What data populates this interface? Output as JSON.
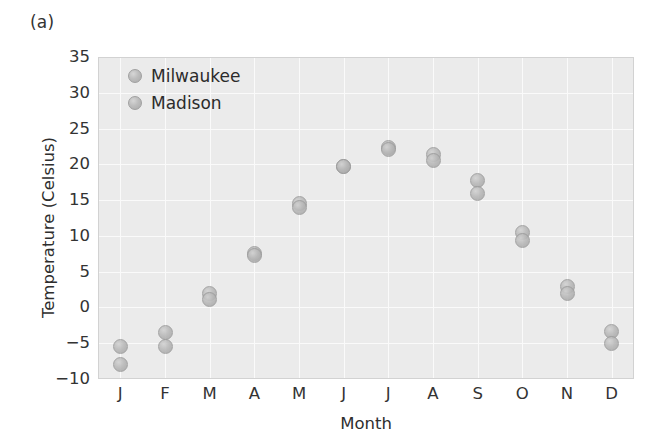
{
  "figure": {
    "panel_label": "(a)",
    "background_color": "#ffffff",
    "plot_background_color": "#ebebeb",
    "grid_color": "#fafafa",
    "marker_color": "#b8b8b8"
  },
  "chart_data": {
    "type": "scatter",
    "title": "",
    "xlabel": "Month",
    "ylabel": "Temperature (Celsius)",
    "categories": [
      "J",
      "F",
      "M",
      "A",
      "M",
      "J",
      "J",
      "A",
      "S",
      "O",
      "N",
      "D"
    ],
    "month_names": [
      "January",
      "February",
      "March",
      "April",
      "May",
      "June",
      "July",
      "August",
      "September",
      "October",
      "November",
      "December"
    ],
    "ylim": [
      -10,
      35
    ],
    "yticks": [
      35,
      30,
      25,
      20,
      15,
      10,
      5,
      0,
      -5,
      -10
    ],
    "ytick_labels": [
      "35",
      "30",
      "25",
      "20",
      "15",
      "10",
      "5",
      "0",
      "−5",
      "−10"
    ],
    "grid": true,
    "legend_position": "upper left",
    "series": [
      {
        "name": "Milwaukee",
        "values": [
          -5.5,
          -3.5,
          2.0,
          7.6,
          14.6,
          19.7,
          22.3,
          21.4,
          17.8,
          10.5,
          3.0,
          -3.4
        ]
      },
      {
        "name": "Madison",
        "values": [
          -8.0,
          -5.5,
          1.1,
          7.3,
          14.0,
          19.7,
          22.1,
          20.5,
          16.0,
          9.3,
          2.0,
          -5.0
        ]
      }
    ]
  },
  "legend": {
    "entries": [
      {
        "label": "Milwaukee",
        "marker": "circle-marker"
      },
      {
        "label": "Madison",
        "marker": "circle-marker"
      }
    ]
  }
}
